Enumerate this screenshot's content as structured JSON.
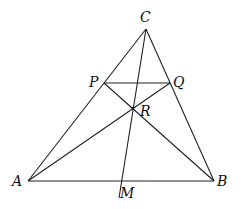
{
  "diagram": {
    "points": {
      "A": {
        "label": "A",
        "x": 28,
        "y": 181
      },
      "B": {
        "label": "B",
        "x": 214,
        "y": 181
      },
      "C": {
        "label": "C",
        "x": 146,
        "y": 29
      },
      "P": {
        "label": "P",
        "x": 104,
        "y": 83
      },
      "Q": {
        "label": "Q",
        "x": 170,
        "y": 83
      },
      "R": {
        "label": "R",
        "x": 133,
        "y": 108
      },
      "M": {
        "label": "M",
        "x": 121,
        "y": 181
      }
    },
    "segments": [
      "AB",
      "BC",
      "CA",
      "PQ",
      "AQ",
      "BP",
      "CM"
    ],
    "line_color": "#222222"
  }
}
